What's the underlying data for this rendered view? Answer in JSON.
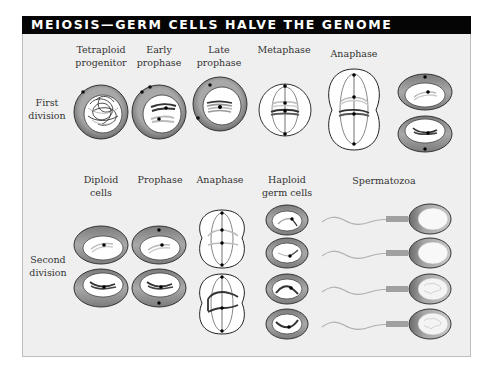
{
  "title": "MEIOSIS—GERM CELLS HALVE THE GENOME",
  "rows": [
    {
      "label_line1": "First",
      "label_line2": "division"
    },
    {
      "label_line1": "Second",
      "label_line2": "division"
    }
  ],
  "first_division": {
    "stages": [
      {
        "line1": "Tetraploid",
        "line2": "progenitor"
      },
      {
        "line1": "Early",
        "line2": "prophase"
      },
      {
        "line1": "Late",
        "line2": "prophase"
      },
      {
        "line1": "Metaphase",
        "line2": ""
      },
      {
        "line1": "Anaphase",
        "line2": ""
      }
    ]
  },
  "second_division": {
    "stages": [
      {
        "line1": "Diploid",
        "line2": "cells"
      },
      {
        "line1": "Prophase",
        "line2": ""
      },
      {
        "line1": "Anaphase",
        "line2": ""
      },
      {
        "line1": "Haploid",
        "line2": "germ cells"
      },
      {
        "line1": "Spermatozoa",
        "line2": ""
      }
    ]
  },
  "colors": {
    "title_bg": "#050505",
    "title_text": "#ffffff",
    "panel_bg": "#efefef",
    "cytoplasm": "#8a8a8a",
    "nucleus": "#ffffff",
    "chromosome_dark": "#333333",
    "chromosome_light": "#b8b8b8"
  }
}
